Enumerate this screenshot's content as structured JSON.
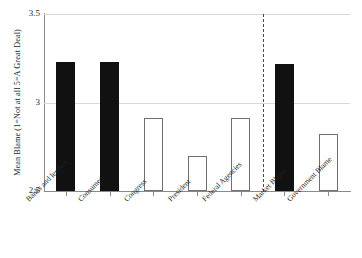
{
  "chart_data": {
    "type": "bar",
    "title": "",
    "xlabel": "",
    "ylabel": "Mean Blame (1=Not at all 5=A Great Deal)",
    "ylim": [
      2.5,
      3.5
    ],
    "yticks": [
      2.5,
      3.0,
      3.5
    ],
    "ytick_labels": [
      "2.5",
      "3",
      "3.5"
    ],
    "grid": true,
    "legend": "none",
    "categories": [
      "Banks and lenders",
      "Consumers",
      "Congress",
      "President",
      "Federal Agencies",
      "Market Blame",
      "Government Blame"
    ],
    "values": [
      3.23,
      3.23,
      2.91,
      2.7,
      2.91,
      3.22,
      2.82
    ],
    "bar_styles": [
      "filled",
      "filled",
      "hollow",
      "hollow",
      "hollow",
      "filled",
      "hollow"
    ],
    "annotations": [
      {
        "type": "vertical-dashed-divider",
        "after_category": "Federal Agencies",
        "note": "separates individual actors from composite blame indices"
      }
    ],
    "colors": {
      "filled_bar": "#111111",
      "hollow_bar_fill": "#ffffff",
      "hollow_bar_border": "#6f6f6f",
      "gridline": "#d8d8d8",
      "axis": "#8a8a8a",
      "divider": "#4a4a4a",
      "text": "#1a1a1a"
    }
  },
  "axis": {
    "y_title": "Mean Blame (1=Not at all 5=A Great Deal)",
    "y_tick_0": "2.5",
    "y_tick_1": "3",
    "y_tick_2": "3.5"
  },
  "x_labels": {
    "l0": "Banks and lenders",
    "l1": "Consumers",
    "l2": "Congress",
    "l3": "President",
    "l4": "Federal Agencies",
    "l5": "Market Blame",
    "l6": "Government Blame"
  }
}
